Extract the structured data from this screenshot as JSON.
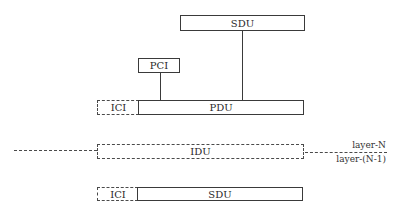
{
  "diagram": {
    "top_sdu": {
      "label": "SDU"
    },
    "pci": {
      "label": "PCI"
    },
    "pdu_row": {
      "ici": "ICI",
      "pdu": "PDU"
    },
    "idu": {
      "label": "IDU"
    },
    "layer_labels": {
      "upper": "layer-N",
      "lower": "layer-(N-1)"
    },
    "bottom_row": {
      "ici": "ICI",
      "sdu": "SDU"
    }
  }
}
